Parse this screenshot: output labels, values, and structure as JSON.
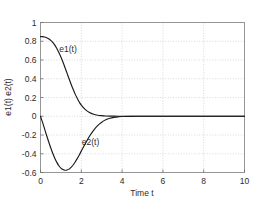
{
  "chart_data": {
    "type": "line",
    "title": "",
    "subtitle": "",
    "xlabel": "Time  t",
    "ylabel": "e1(t)   e2(t)",
    "xlim": [
      0,
      10
    ],
    "ylim": [
      -0.6,
      1
    ],
    "xticks": [
      0,
      2,
      4,
      6,
      8,
      10
    ],
    "xticklabels": [
      "0",
      "2",
      "4",
      "6",
      "8",
      "10"
    ],
    "yticks": [
      -0.6,
      -0.4,
      -0.2,
      0,
      0.2,
      0.4,
      0.6,
      0.8,
      1
    ],
    "yticklabels": [
      "-0.6",
      "-0.4",
      "-0.2",
      "0",
      "0.2",
      "0.4",
      "0.6",
      "0.8",
      "1"
    ],
    "grid": true,
    "grid_style": "dotted",
    "legend": "inline-annotations",
    "legend_position": "inline",
    "annotations": [
      {
        "text": "e1(t)",
        "x": 1.35,
        "y": 0.72
      },
      {
        "text": "e2(t)",
        "x": 2.45,
        "y": -0.27
      }
    ],
    "series": [
      {
        "name": "e1(t)",
        "color": "#1a1a1a",
        "x": [
          0,
          0.1,
          0.2,
          0.3,
          0.4,
          0.5,
          0.6,
          0.7,
          0.8,
          0.9,
          1.0,
          1.1,
          1.2,
          1.3,
          1.4,
          1.5,
          1.6,
          1.7,
          1.8,
          1.9,
          2.0,
          2.2,
          2.4,
          2.6,
          2.8,
          3.0,
          3.2,
          3.4,
          3.6,
          3.8,
          4.0,
          4.5,
          5.0,
          6.0,
          7.0,
          8.0,
          9.0,
          10.0
        ],
        "values": [
          0.85,
          0.849,
          0.845,
          0.838,
          0.826,
          0.809,
          0.787,
          0.758,
          0.722,
          0.68,
          0.632,
          0.578,
          0.52,
          0.46,
          0.4,
          0.342,
          0.287,
          0.236,
          0.191,
          0.152,
          0.119,
          0.07,
          0.039,
          0.021,
          0.011,
          0.006,
          0.003,
          0.0015,
          0.0008,
          0.0004,
          0.0002,
          0.0,
          0.0,
          0.0,
          0.0,
          0.0,
          0.0,
          0.0
        ]
      },
      {
        "name": "e2(t)",
        "color": "#1a1a1a",
        "x": [
          0,
          0.1,
          0.2,
          0.3,
          0.4,
          0.5,
          0.6,
          0.7,
          0.8,
          0.9,
          1.0,
          1.1,
          1.2,
          1.3,
          1.4,
          1.5,
          1.6,
          1.7,
          1.8,
          1.9,
          2.0,
          2.2,
          2.4,
          2.6,
          2.8,
          3.0,
          3.2,
          3.4,
          3.6,
          3.8,
          4.0,
          4.5,
          5.0,
          6.0,
          7.0,
          8.0,
          9.0,
          10.0
        ],
        "values": [
          0.0,
          -0.065,
          -0.135,
          -0.205,
          -0.272,
          -0.336,
          -0.395,
          -0.447,
          -0.492,
          -0.528,
          -0.553,
          -0.569,
          -0.576,
          -0.574,
          -0.564,
          -0.545,
          -0.52,
          -0.488,
          -0.452,
          -0.413,
          -0.372,
          -0.29,
          -0.214,
          -0.15,
          -0.1,
          -0.063,
          -0.038,
          -0.022,
          -0.012,
          -0.006,
          -0.003,
          -0.0008,
          -0.0002,
          0.0,
          0.0,
          0.0,
          0.0,
          0.0
        ]
      }
    ]
  },
  "colors": {
    "curve": "#1a1a1a",
    "grid": "#c9c9c9",
    "frame": "#8c8c8c",
    "text": "#2b2b2b",
    "background": "#ffffff"
  }
}
